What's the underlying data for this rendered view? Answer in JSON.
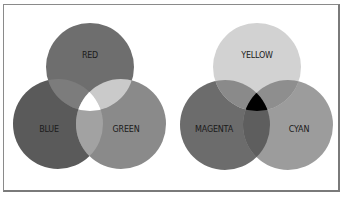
{
  "additive": {
    "title": "Additive color mixing",
    "circles": [
      {
        "id": "red",
        "label": "RED",
        "cx": 90,
        "cy": 67,
        "r": 44,
        "color": "#6e6e6e"
      },
      {
        "id": "blue",
        "label": "BLUE",
        "cx": 58,
        "cy": 124,
        "r": 45,
        "color": "#5a5a5a"
      },
      {
        "id": "green",
        "label": "GREEN",
        "cx": 121,
        "cy": 124,
        "r": 45,
        "color": "#8a8a8a"
      }
    ],
    "overlaps": {
      "red_blue": "#7c7c7c",
      "red_green": "#cacaca",
      "blue_green": "#a2a2a2",
      "center": "#ffffff"
    }
  },
  "subtractive": {
    "title": "Subtractive color mixing",
    "circles": [
      {
        "id": "yellow",
        "label": "YELLOW",
        "cx": 257,
        "cy": 67,
        "r": 44,
        "color": "#d2d2d2"
      },
      {
        "id": "magenta",
        "label": "MAGENTA",
        "cx": 225,
        "cy": 125,
        "r": 45,
        "color": "#6c6c6c"
      },
      {
        "id": "cyan",
        "label": "CYAN",
        "cx": 288,
        "cy": 125,
        "r": 45,
        "color": "#9c9c9c"
      }
    ],
    "overlaps": {
      "yellow_magenta": "#8a8a8a",
      "yellow_cyan": "#8e8e8e",
      "magenta_cyan": "#5e5e5e",
      "center": "#000000"
    }
  }
}
